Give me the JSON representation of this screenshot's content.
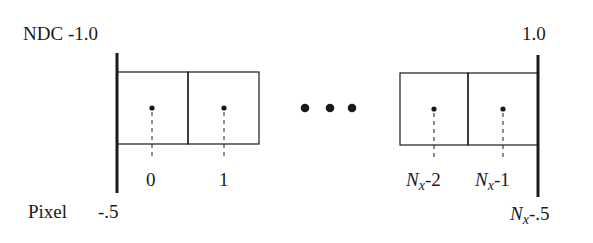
{
  "diagram": {
    "ndc": {
      "axis_label": "NDC",
      "left_value": "-1.0",
      "right_value": "1.0"
    },
    "pixel": {
      "axis_label": "Pixel",
      "left_value": "-.5",
      "right_value_var": "N",
      "right_value_sub": "x",
      "right_value_suffix": "-.5"
    },
    "cells": [
      {
        "label": "0"
      },
      {
        "label": "1"
      },
      {
        "label_var": "N",
        "label_sub": "x",
        "label_suffix": "-2"
      },
      {
        "label_var": "N",
        "label_sub": "x",
        "label_suffix": "-1"
      }
    ],
    "ellipsis": "• • •",
    "colors": {
      "stroke": "#1a1a1a",
      "background": "#ffffff"
    }
  }
}
